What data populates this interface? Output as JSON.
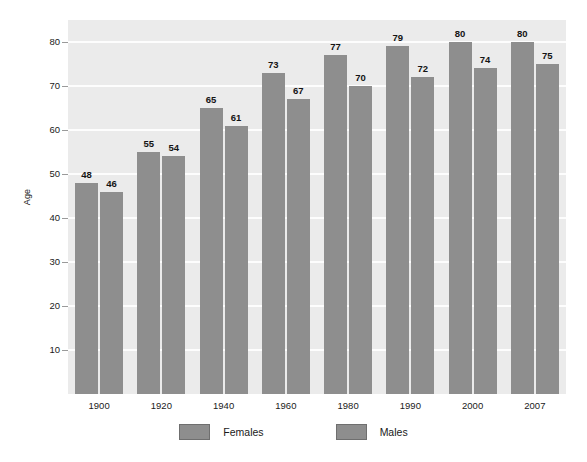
{
  "chart_data": {
    "type": "bar",
    "title": "",
    "subtitle": "",
    "xlabel": "",
    "ylabel": "Age",
    "categories": [
      "1900",
      "1920",
      "1940",
      "1960",
      "1980",
      "1990",
      "2000",
      "2007"
    ],
    "series": [
      {
        "name": "Females",
        "color": "#8e8e8e",
        "values": [
          48,
          55,
          65,
          73,
          77,
          79,
          80,
          80
        ]
      },
      {
        "name": "Males",
        "color": "#8e8e8e",
        "values": [
          46,
          54,
          61,
          67,
          70,
          72,
          74,
          75
        ]
      }
    ],
    "ylim": [
      0,
      85
    ],
    "yticks": [
      10,
      20,
      30,
      40,
      50,
      60,
      70,
      80
    ],
    "ytick_labels": [
      "10",
      "20",
      "30",
      "40",
      "50",
      "60",
      "70",
      "80"
    ],
    "grid": true,
    "grid_axis": "y",
    "grid_color": "#fdfdfd",
    "legend_position": "bottom",
    "plot_background": "#ebebeb",
    "figure_background": "#ffffff",
    "data_labels": true,
    "data_label_bold": true
  },
  "axes": {
    "y_title": "Age"
  },
  "legend": {
    "entries": [
      {
        "label": "Females",
        "swatch_color": "#8e8e8e",
        "swatch_border": "#6f6f6f"
      },
      {
        "label": "Males",
        "swatch_color": "#8e8e8e",
        "swatch_border": "#6f6f6f"
      }
    ]
  }
}
